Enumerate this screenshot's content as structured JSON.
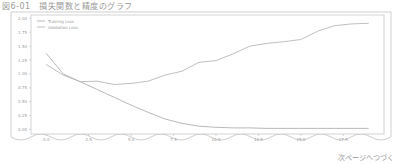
{
  "page": {
    "title": "図6-01　損失関数と精度のグラフ",
    "footer": "次ページへつづく"
  },
  "chart_data": {
    "type": "line",
    "title": "",
    "xlabel": "",
    "ylabel": "",
    "x": [
      0,
      1,
      2,
      3,
      4,
      5,
      6,
      7,
      8,
      9,
      10,
      11,
      12,
      13,
      14,
      15,
      16,
      17,
      18,
      19
    ],
    "xticks": [
      "0.0",
      "2.5",
      "5.0",
      "7.5",
      "10.0",
      "12.5",
      "15.0",
      "17.5"
    ],
    "xtick_values": [
      0,
      2.5,
      5,
      7.5,
      10,
      12.5,
      15,
      17.5
    ],
    "yticks": [
      "0.00",
      "0.25",
      "0.50",
      "0.75",
      "1.00",
      "1.25",
      "1.50",
      "1.75",
      "2.00"
    ],
    "ytick_values": [
      0,
      0.25,
      0.5,
      0.75,
      1,
      1.25,
      1.5,
      1.75,
      2
    ],
    "xlim": [
      -0.9,
      19.9
    ],
    "ylim": [
      -0.08,
      2.06
    ],
    "grid": false,
    "legend_position": "upper left",
    "series": [
      {
        "name": "Training Loss",
        "color": "#b0b0b0",
        "values": [
          1.37,
          1.0,
          0.86,
          0.72,
          0.58,
          0.44,
          0.31,
          0.19,
          0.11,
          0.06,
          0.04,
          0.03,
          0.03,
          0.02,
          0.02,
          0.02,
          0.02,
          0.02,
          0.02,
          0.02
        ]
      },
      {
        "name": "Validation Loss",
        "color": "#b8b8b8",
        "values": [
          1.17,
          0.98,
          0.86,
          0.87,
          0.81,
          0.83,
          0.87,
          0.98,
          1.05,
          1.21,
          1.24,
          1.36,
          1.5,
          1.55,
          1.58,
          1.62,
          1.77,
          1.87,
          1.9,
          1.91
        ]
      }
    ]
  }
}
